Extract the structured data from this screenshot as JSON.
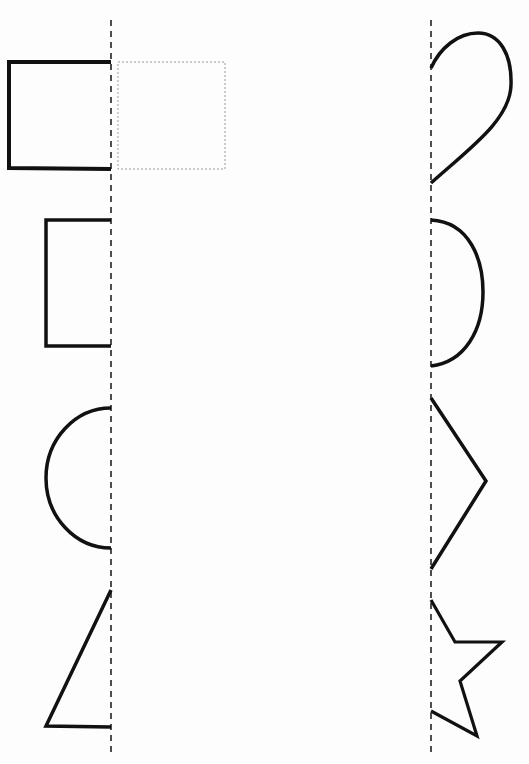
{
  "worksheet": {
    "type": "symmetry-completion",
    "colors": {
      "background": "#fdfdfd",
      "stroke": "#111111",
      "guide_line": "#222222",
      "hint_outline": "#9a9a9a"
    },
    "symmetry_lines": [
      {
        "name": "left-column-axis",
        "x": 111
      },
      {
        "name": "right-column-axis",
        "x": 431
      }
    ],
    "left_column_shapes": [
      "square-half",
      "rectangle-half",
      "semicircle-half",
      "triangle-half"
    ],
    "right_column_shapes": [
      "drop-half",
      "semicircle-half",
      "chevron-half",
      "star-half"
    ],
    "hint": {
      "shape": "square",
      "style": "dotted-outline"
    }
  }
}
